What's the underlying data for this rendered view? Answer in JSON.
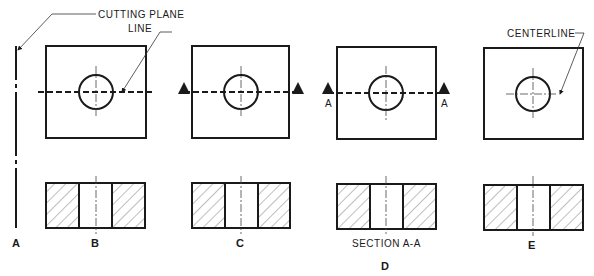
{
  "figure": {
    "annotations": {
      "cutting_plane_line_1": "CUTTING PLANE",
      "cutting_plane_line_2": "LINE",
      "centerline": "CENTERLINE",
      "section_caption": "SECTION A-A"
    },
    "views": [
      {
        "id": "A",
        "label": "A"
      },
      {
        "id": "B",
        "label": "B"
      },
      {
        "id": "C",
        "label": "C"
      },
      {
        "id": "D",
        "label": "D",
        "cut_labels": [
          "A",
          "A"
        ]
      },
      {
        "id": "E",
        "label": "E"
      }
    ],
    "colors": {
      "line": "#1a1a1a",
      "background": "#ffffff"
    }
  }
}
